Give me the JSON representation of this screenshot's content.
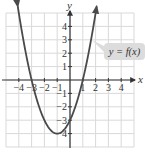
{
  "chart_data": {
    "type": "line",
    "title": "",
    "xlabel": "x",
    "ylabel": "y",
    "xlim": [
      -5,
      5
    ],
    "ylim": [
      -5,
      5
    ],
    "grid": true,
    "x_ticks": [
      -4,
      -3,
      -2,
      -1,
      1,
      2,
      3,
      4
    ],
    "y_ticks": [
      -4,
      -3,
      -2,
      -1,
      1,
      2,
      3,
      4
    ],
    "x_tick_labels": [
      "−4",
      "−3",
      "−2",
      "−1",
      "1",
      "2",
      "3",
      "4"
    ],
    "y_tick_labels": [
      "4",
      "3",
      "2",
      "1",
      "−1",
      "−2",
      "−3",
      "−4"
    ],
    "series": [
      {
        "name": "y = f(x)",
        "function": "x^2 + 2x - 3",
        "x": [
          -4,
          -3,
          -2,
          -1,
          0,
          1,
          2
        ],
        "y": [
          5,
          0,
          -3,
          -4,
          -3,
          0,
          5
        ],
        "vertex": [
          -1,
          -4
        ],
        "x_intercepts": [
          -3,
          1
        ],
        "y_intercept": -3,
        "arrows_at_ends": true
      }
    ],
    "annotations": [
      {
        "text": "y = f(x)",
        "type": "callout",
        "points_to": "curve right branch near (1.7, 3)"
      }
    ],
    "colors": {
      "curve": "#4a4a4a",
      "grid": "#d9d9d9",
      "axis": "#333333",
      "callout_bg": "#dcdcdc"
    }
  },
  "labels": {
    "x_axis": "x",
    "y_axis": "y",
    "callout": "y = f(x)",
    "x_ticks": [
      "−4",
      "−3",
      "−2",
      "−1",
      "1",
      "2",
      "3",
      "4"
    ],
    "y_ticks_pos": [
      "4",
      "3",
      "2",
      "1"
    ],
    "y_ticks_neg": [
      "−1",
      "−2",
      "−3",
      "−4"
    ]
  }
}
